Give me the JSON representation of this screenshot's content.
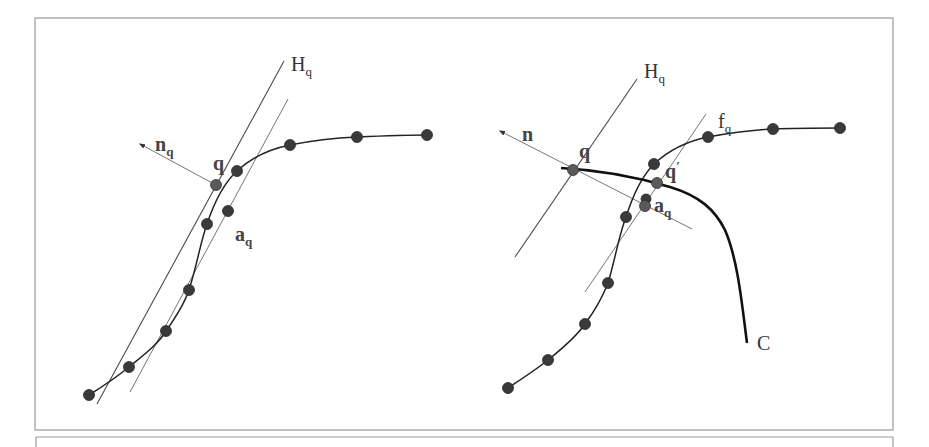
{
  "figure": {
    "panels": [
      {
        "id": "left",
        "labels": {
          "plane": {
            "main": "H",
            "sub": "q"
          },
          "normal": {
            "main": "n",
            "sub": "q"
          },
          "point": {
            "main": "q",
            "sub": ""
          },
          "anchor": {
            "main": "a",
            "sub": "q"
          }
        }
      },
      {
        "id": "right",
        "labels": {
          "plane": {
            "main": "H",
            "sub": "q"
          },
          "fit": {
            "main": "f",
            "sub": "q"
          },
          "normal": {
            "main": "n",
            "sub": ""
          },
          "point": {
            "main": "q",
            "sub": ""
          },
          "projected": {
            "main": "q",
            "sup": "′"
          },
          "anchor": {
            "main": "a",
            "sub": "q"
          },
          "curve": {
            "main": "C",
            "sub": ""
          }
        }
      }
    ],
    "colors": {
      "ink": "#222222",
      "frame": "#9a9a9a",
      "point": "#3a3a3a"
    }
  }
}
